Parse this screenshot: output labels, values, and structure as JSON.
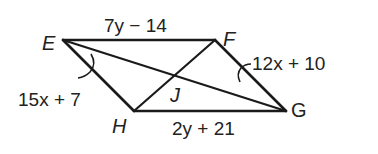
{
  "figure": {
    "type": "parallelogram-with-diagonals",
    "vertices": {
      "E": {
        "label": "E"
      },
      "F": {
        "label": "F"
      },
      "G": {
        "label": "G"
      },
      "H": {
        "label": "H"
      },
      "J": {
        "label": "J"
      }
    },
    "segments": {
      "EF": {
        "expression": "7y − 14"
      },
      "HG": {
        "expression": "2y + 21"
      }
    },
    "angles": {
      "at_E": {
        "expression": "15x + 7"
      },
      "at_G": {
        "expression": "12x + 10"
      }
    },
    "colors": {
      "stroke": "#1a1a1a",
      "text": "#222222",
      "background": "#ffffff"
    }
  }
}
